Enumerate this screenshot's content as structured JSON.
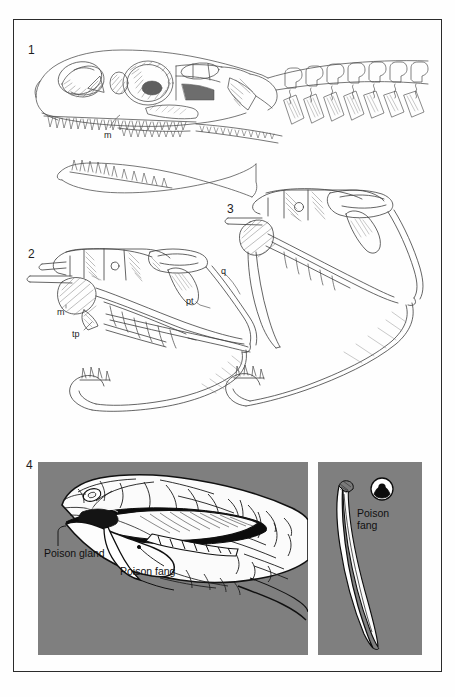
{
  "plate": {
    "type": "scientific-illustration-plate",
    "subject": "Comparative snake and lizard skull anatomy with venom apparatus",
    "background_color": "#fefefe",
    "frame_color": "#2b2b2b",
    "panel_gray": "#7f7f7f"
  },
  "figures": [
    {
      "number": "1",
      "caption": "",
      "description": "Lizard (varanid) skull in lateral view with cervical vertebrae and detached lower jaw",
      "labels": [
        {
          "key": "m",
          "text": "m",
          "meaning": "maxilla"
        }
      ]
    },
    {
      "number": "2",
      "caption": "",
      "description": "Intermediate snake skull in lateral view showing kinetic jaw elements",
      "labels": [
        {
          "key": "m",
          "text": "m",
          "meaning": "maxilla"
        },
        {
          "key": "tp",
          "text": "tp",
          "meaning": "transverse process / ectopterygoid"
        },
        {
          "key": "pt",
          "text": "pt",
          "meaning": "pterygoid"
        },
        {
          "key": "q",
          "text": "q",
          "meaning": "quadrate"
        }
      ]
    },
    {
      "number": "3",
      "caption": "",
      "description": "Viperid skull in lateral view with rotated maxilla and erect fang",
      "labels": []
    },
    {
      "number": "4",
      "caption": "",
      "description": "Venomous snake head with open mouth, and detail of an isolated poison fang with cross-section",
      "labels": [
        {
          "key": "poison-gland",
          "text": "Poison gland"
        },
        {
          "key": "poison-fang",
          "text": "Poison fang"
        },
        {
          "key": "poison-fang-detail",
          "text": "Poison\nfang"
        }
      ]
    }
  ],
  "figure_numbers": {
    "one": "1",
    "two": "2",
    "three": "3",
    "four": "4"
  },
  "anatomy_labels": {
    "m_fig1": "m",
    "m_fig2": "m",
    "tp": "tp",
    "pt": "pt",
    "q": "q",
    "poison_gland": "Poison gland",
    "poison_fang": "Poison fang",
    "poison_fang_detail_line1": "Poison",
    "poison_fang_detail_line2": "fang"
  }
}
